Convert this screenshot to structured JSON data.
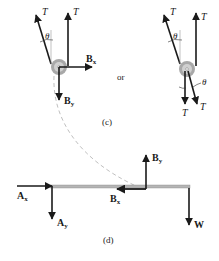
{
  "figure": {
    "panel_c": {
      "caption": "(c)",
      "separator": "or",
      "left_diagram": {
        "tension_left": "T",
        "tension_right": "T",
        "angle": "θ",
        "force_bx": "B",
        "force_bx_sub": "x",
        "force_by": "B",
        "force_by_sub": "y"
      },
      "right_diagram": {
        "tension_top_left": "T",
        "tension_top_right": "T",
        "angle_top": "θ",
        "angle_bottom": "θ",
        "tension_bottom_left": "T",
        "tension_bottom_right": "T"
      }
    },
    "panel_d": {
      "caption": "(d)",
      "force_ax": "A",
      "force_ax_sub": "x",
      "force_ay": "A",
      "force_ay_sub": "y",
      "force_by": "B",
      "force_by_sub": "y",
      "force_bx": "B",
      "force_bx_sub": "x",
      "weight": "W"
    },
    "colors": {
      "arrow": "#1a1a1a",
      "pulley_outer": "#a8a8a8",
      "pulley_inner": "#d0d0d0",
      "beam": "#b5b5b5",
      "dashed_path": "#c0c0c0",
      "rope": "#9a9a9a"
    }
  }
}
